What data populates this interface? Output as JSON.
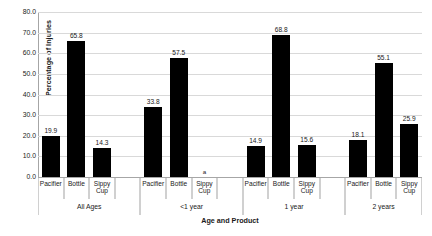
{
  "chart_data": {
    "type": "bar",
    "title": "",
    "xlabel": "Age and Product",
    "ylabel": "Percentage of Injuries",
    "ylim": [
      0,
      80
    ],
    "ytick_step": 10,
    "ytick_labels": [
      "0.0",
      "10.0",
      "20.0",
      "30.0",
      "40.0",
      "50.0",
      "60.0",
      "70.0",
      "80.0"
    ],
    "grid": true,
    "legend": "none",
    "bar_color": "#000000",
    "grid_color": "#D9D9D9",
    "axis_color": "#A6A6A6",
    "categories": [
      "Pacifier",
      "Bottle",
      "Sippy Cup"
    ],
    "groups": [
      {
        "label": "All Ages",
        "bars": [
          {
            "category": "Pacifier",
            "value": 19.9,
            "label": "19.9",
            "suppressed": false
          },
          {
            "category": "Bottle",
            "value": 65.8,
            "label": "65.8",
            "suppressed": false
          },
          {
            "category": "Sippy Cup",
            "value": 14.3,
            "label": "14.3",
            "suppressed": false
          }
        ]
      },
      {
        "label": "<1 year",
        "bars": [
          {
            "category": "Pacifier",
            "value": 33.8,
            "label": "33.8",
            "suppressed": false
          },
          {
            "category": "Bottle",
            "value": 57.5,
            "label": "57.5",
            "suppressed": false
          },
          {
            "category": "Sippy Cup",
            "value": 0,
            "label": "a",
            "suppressed": true
          }
        ]
      },
      {
        "label": "1 year",
        "bars": [
          {
            "category": "Pacifier",
            "value": 14.9,
            "label": "14.9",
            "suppressed": false
          },
          {
            "category": "Bottle",
            "value": 68.8,
            "label": "68.8",
            "suppressed": false
          },
          {
            "category": "Sippy Cup",
            "value": 15.6,
            "label": "15.6",
            "suppressed": false
          }
        ]
      },
      {
        "label": "2 years",
        "bars": [
          {
            "category": "Pacifier",
            "value": 18.1,
            "label": "18.1",
            "suppressed": false
          },
          {
            "category": "Bottle",
            "value": 55.1,
            "label": "55.1",
            "suppressed": false
          },
          {
            "category": "Sippy Cup",
            "value": 25.9,
            "label": "25.9",
            "suppressed": false
          }
        ]
      }
    ]
  }
}
